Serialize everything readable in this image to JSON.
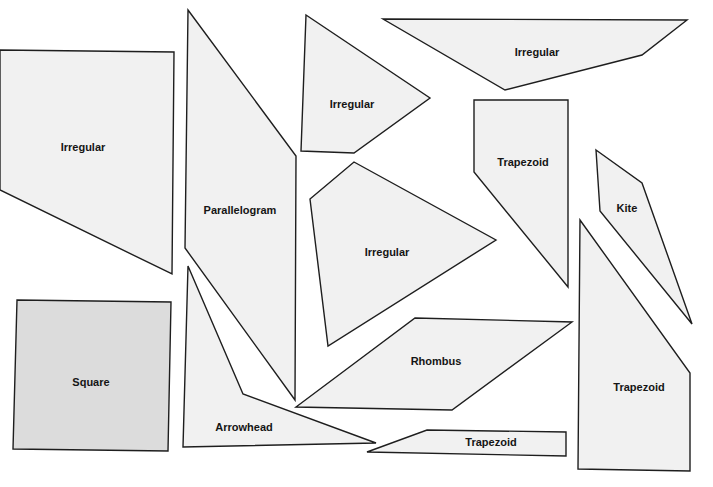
{
  "colors": {
    "shape_fill": "#f1f1f1",
    "square_fill": "#dcdcdc",
    "stroke": "#1e1e1e",
    "label": "#151515",
    "background": "#ffffff"
  },
  "shapes": [
    {
      "id": "irregular-left",
      "label": "Irregular",
      "kind": "irregular"
    },
    {
      "id": "parallelogram",
      "label": "Parallelogram",
      "kind": "parallelogram"
    },
    {
      "id": "irregular-top-middle",
      "label": "Irregular",
      "kind": "irregular"
    },
    {
      "id": "irregular-top-right",
      "label": "Irregular",
      "kind": "irregular"
    },
    {
      "id": "trapezoid-tall",
      "label": "Trapezoid",
      "kind": "trapezoid"
    },
    {
      "id": "kite",
      "label": "Kite",
      "kind": "kite"
    },
    {
      "id": "irregular-center",
      "label": "Irregular",
      "kind": "irregular"
    },
    {
      "id": "square",
      "label": "Square",
      "kind": "square"
    },
    {
      "id": "arrowhead",
      "label": "Arrowhead",
      "kind": "arrowhead"
    },
    {
      "id": "rhombus",
      "label": "Rhombus",
      "kind": "rhombus"
    },
    {
      "id": "trapezoid-thin",
      "label": "Trapezoid",
      "kind": "trapezoid"
    },
    {
      "id": "trapezoid-right",
      "label": "Trapezoid",
      "kind": "trapezoid"
    }
  ]
}
